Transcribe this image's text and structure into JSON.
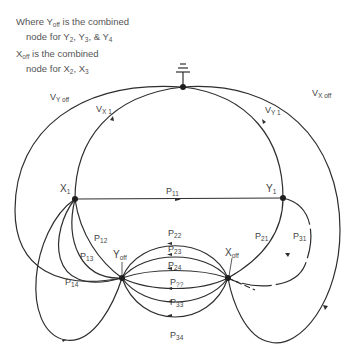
{
  "notes": [
    {
      "line1_pre": "Where Y",
      "line1_sub": "off",
      "line1_post": " is the combined",
      "line2": "node for Y",
      "line2_subs": [
        "2",
        "3",
        "4"
      ]
    },
    {
      "line1_pre": "X",
      "line1_sub": "off",
      "line1_post": " is the combined",
      "line2": "node for X",
      "line2_subs": [
        "2",
        "3"
      ]
    }
  ],
  "note_text": {
    "n1_a": "Where Y",
    "n1_a_sub": "off",
    "n1_b": " is the combined",
    "n1_c": "node for Y",
    "n1_c_sub": "2",
    "n1_d": ", Y",
    "n1_d_sub": "3",
    "n1_e": ", & Y",
    "n1_e_sub": "4",
    "n2_a": "X",
    "n2_a_sub": "off",
    "n2_b": " is the combined",
    "n2_c": "node for X",
    "n2_c_sub": "2",
    "n2_d": ", X",
    "n2_d_sub": "3"
  },
  "nodes": {
    "ground": {
      "label": "ground-reference"
    },
    "x1": {
      "base": "X",
      "sub": "1"
    },
    "y1": {
      "base": "Y",
      "sub": "1"
    },
    "yoff": {
      "base": "Y",
      "sub": "off"
    },
    "xoff": {
      "base": "X",
      "sub": "off"
    }
  },
  "edges": {
    "vyoff": {
      "base": "V",
      "sub": "Y off"
    },
    "vx1": {
      "base": "V",
      "sub": "X 1"
    },
    "vy1": {
      "base": "V",
      "sub": "Y 1"
    },
    "vxoff": {
      "base": "V",
      "sub": "X off"
    },
    "p11": {
      "base": "P",
      "sub": "11"
    },
    "p12": {
      "base": "P",
      "sub": "12"
    },
    "p13": {
      "base": "P",
      "sub": "13"
    },
    "p14": {
      "base": "P",
      "sub": "14"
    },
    "p21": {
      "base": "P",
      "sub": "21"
    },
    "p31": {
      "base": "P",
      "sub": "31"
    },
    "p22": {
      "base": "P",
      "sub": "22"
    },
    "p23": {
      "base": "P",
      "sub": "23"
    },
    "p24": {
      "base": "P",
      "sub": "24"
    },
    "p32": {
      "base": "P",
      "sub": "??"
    },
    "p33": {
      "base": "P",
      "sub": "33"
    },
    "p34": {
      "base": "P",
      "sub": "34"
    }
  },
  "colors": {
    "line": "#2e2e2e",
    "text": "#444444",
    "background": "#ffffff"
  }
}
